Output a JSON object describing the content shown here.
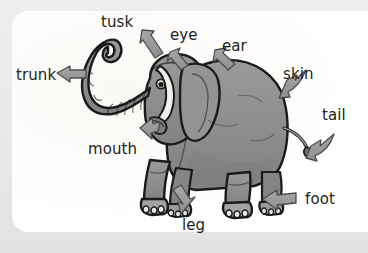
{
  "card": {
    "background_color": "#ffffff",
    "page_background_color": "#e9e9e9"
  },
  "illustration": {
    "name": "elephant-anatomy-diagram",
    "subject": "elephant",
    "body_color": "#8f8f8f",
    "body_shadow_color": "#7a7a7a",
    "outline_color": "#1a1a1a",
    "arrow_fill_color": "#9a9a9a",
    "arrow_outline_color": "#4a4a4a"
  },
  "labels": [
    {
      "id": "trunk",
      "text": "trunk"
    },
    {
      "id": "tusk",
      "text": "tusk"
    },
    {
      "id": "eye",
      "text": "eye"
    },
    {
      "id": "ear",
      "text": "ear"
    },
    {
      "id": "skin",
      "text": "skin"
    },
    {
      "id": "tail",
      "text": "tail"
    },
    {
      "id": "mouth",
      "text": "mouth"
    },
    {
      "id": "leg",
      "text": "leg"
    },
    {
      "id": "foot",
      "text": "foot"
    }
  ]
}
